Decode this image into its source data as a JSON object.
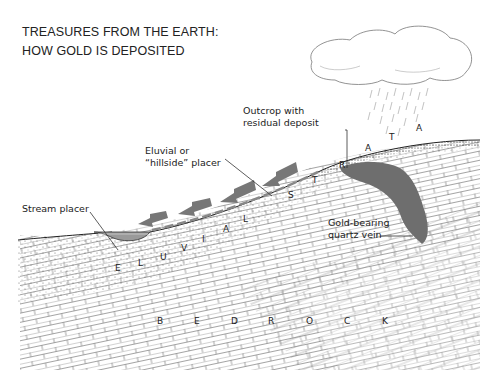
{
  "title": {
    "line1": "TREASURES FROM THE EARTH:",
    "line2": "HOW GOLD IS DEPOSITED"
  },
  "labels": {
    "outcrop_line1": "Outcrop with",
    "outcrop_line2": "residual deposit",
    "eluvial_line1": "Eluvial or",
    "eluvial_line2": "“hillside” placer",
    "stream": "Stream placer",
    "vein_line1": "Gold-bearing",
    "vein_line2": "quartz vein"
  },
  "strata_letters": {
    "eluvial": [
      "E",
      "L",
      "U",
      "V",
      "I",
      "A",
      "L"
    ],
    "strata": [
      "S",
      "T",
      "R",
      "A",
      "T",
      "A"
    ],
    "bedrock": [
      "B",
      "E",
      "D",
      "R",
      "O",
      "C",
      "K"
    ]
  },
  "colors": {
    "ink": "#222222",
    "vein": "#6e6e6e",
    "arrow": "#777777",
    "stream_water": "#8a8a8a"
  }
}
